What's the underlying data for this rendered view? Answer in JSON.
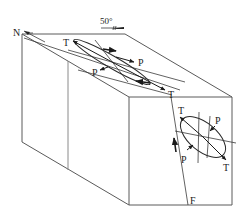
{
  "figure": {
    "type": "block-diagram",
    "labels": {
      "north": "N",
      "dip_angle": "50°",
      "fault": "F",
      "top_T_left": "T",
      "top_P_left": "P",
      "top_P_right": "P",
      "top_T_right": "T",
      "front_T_top": "T",
      "front_P_top": "P",
      "front_P_bottom": "P",
      "front_T_bottom": "T"
    },
    "colors": {
      "edges": "#5a5a5a",
      "ink": "#222222",
      "background": "#ffffff"
    }
  }
}
